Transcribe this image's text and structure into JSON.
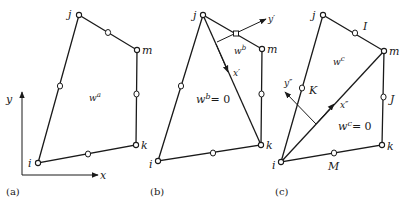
{
  "figure": {
    "panels": [
      {
        "id": "a",
        "caption": "(a)",
        "nodes": {
          "i": "i",
          "j": "j",
          "m": "m",
          "k": "k"
        },
        "region_label": "w",
        "region_sup": "a",
        "axes": {
          "x": "x",
          "y": "y"
        }
      },
      {
        "id": "b",
        "caption": "(b)",
        "nodes": {
          "i": "i",
          "j": "j",
          "m": "m",
          "k": "k"
        },
        "region_upper_label": "w",
        "region_upper_sup": "b",
        "region_lower_label": "w",
        "region_lower_sup": "b",
        "region_lower_eq": "= 0",
        "local_axes": {
          "x": "x′",
          "y": "y′"
        }
      },
      {
        "id": "c",
        "caption": "(c)",
        "nodes": {
          "i": "i",
          "j": "j",
          "m": "m",
          "k": "k"
        },
        "midside_labels": {
          "I": "I",
          "J": "J",
          "K": "K",
          "M": "M"
        },
        "region_upper_label": "w",
        "region_upper_sup": "c",
        "region_lower_label": "w",
        "region_lower_sup": "c",
        "region_lower_eq": "= 0",
        "local_axes": {
          "x": "x″",
          "y": "y″"
        }
      }
    ]
  },
  "colors": {
    "ink": "#1a1a1a",
    "background": "#ffffff"
  }
}
